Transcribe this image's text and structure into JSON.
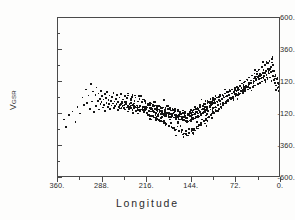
{
  "figure": {
    "background_color": "#fdfdfc",
    "frame_color": "#4a4a4a",
    "point_color": "#141414"
  },
  "axes": {
    "y_title_symbol": "V",
    "y_title_subscript": "GSR",
    "x_title": "Longitude"
  },
  "chart_data": {
    "type": "scatter",
    "title": "",
    "subtitle": "",
    "xlabel": "Longitude",
    "ylabel": "V_GSR",
    "xlim": [
      360,
      0
    ],
    "ylim": [
      -600,
      600
    ],
    "x_inverted": true,
    "grid": false,
    "legend": null,
    "x_ticks": [
      360,
      288,
      216,
      144,
      72,
      0
    ],
    "x_tick_labels": [
      "360.",
      "288.",
      "216.",
      "144.",
      "72.",
      "0."
    ],
    "x_minor_ticks": [
      324,
      252,
      180,
      108,
      36
    ],
    "y_ticks": [
      600,
      360,
      120,
      -120,
      -360,
      -600
    ],
    "y_tick_labels": [
      "600.",
      "360.",
      "120.",
      "-120.",
      "-360.",
      "-600."
    ],
    "y_minor_ticks": [
      480,
      240,
      0,
      -240,
      -480
    ],
    "marker": "square",
    "marker_size": 1.7,
    "n_points": 648,
    "series": [
      {
        "name": "HI clouds",
        "points": [
          [
            352,
            -155
          ],
          [
            349,
            -210
          ],
          [
            344,
            -120
          ],
          [
            338,
            -95
          ],
          [
            333,
            -175
          ],
          [
            330,
            -60
          ],
          [
            326,
            -110
          ],
          [
            322,
            10
          ],
          [
            319,
            -45
          ],
          [
            316,
            70
          ],
          [
            314,
            -30
          ],
          [
            312,
            25
          ],
          [
            310,
            -75
          ],
          [
            308,
            110
          ],
          [
            306,
            -20
          ],
          [
            305,
            55
          ],
          [
            303,
            -100
          ],
          [
            301,
            30
          ],
          [
            300,
            -55
          ],
          [
            299,
            85
          ],
          [
            297,
            -15
          ],
          [
            296,
            40
          ],
          [
            295,
            -80
          ],
          [
            294,
            0
          ],
          [
            293,
            -40
          ],
          [
            292,
            60
          ],
          [
            291,
            -25
          ],
          [
            290,
            20
          ],
          [
            289,
            -65
          ],
          [
            288,
            -5
          ],
          [
            287,
            -45
          ],
          [
            286,
            35
          ],
          [
            285,
            -90
          ],
          [
            284,
            5
          ],
          [
            283,
            -30
          ],
          [
            282,
            50
          ],
          [
            281,
            -60
          ],
          [
            280,
            -10
          ],
          [
            279,
            -40
          ],
          [
            278,
            25
          ],
          [
            277,
            -75
          ],
          [
            276,
            -15
          ],
          [
            275,
            -50
          ],
          [
            274,
            15
          ],
          [
            273,
            -35
          ],
          [
            272,
            45
          ],
          [
            271,
            -70
          ],
          [
            270,
            -20
          ],
          [
            269,
            -55
          ],
          [
            268,
            0
          ],
          [
            267,
            -40
          ],
          [
            266,
            30
          ],
          [
            265,
            -85
          ],
          [
            264,
            -25
          ],
          [
            263,
            -60
          ],
          [
            262,
            10
          ],
          [
            261,
            -45
          ],
          [
            260,
            35
          ],
          [
            259,
            -70
          ],
          [
            258,
            -30
          ],
          [
            257,
            -55
          ],
          [
            256,
            -5
          ],
          [
            255,
            -50
          ],
          [
            254,
            20
          ],
          [
            253,
            -80
          ],
          [
            252,
            -35
          ],
          [
            251,
            -65
          ],
          [
            250,
            5
          ],
          [
            249,
            -55
          ],
          [
            248,
            25
          ],
          [
            247,
            -75
          ],
          [
            246,
            -40
          ],
          [
            245,
            -60
          ],
          [
            244,
            -10
          ],
          [
            243,
            -50
          ],
          [
            242,
            15
          ],
          [
            241,
            -85
          ],
          [
            240,
            -45
          ],
          [
            239,
            -70
          ],
          [
            238,
            -15
          ],
          [
            237,
            -60
          ],
          [
            236,
            10
          ],
          [
            235,
            -90
          ],
          [
            234,
            -50
          ],
          [
            233,
            -75
          ],
          [
            232,
            -20
          ],
          [
            231,
            -65
          ],
          [
            230,
            0
          ],
          [
            229,
            -95
          ],
          [
            228,
            -55
          ],
          [
            227,
            -80
          ],
          [
            226,
            -25
          ],
          [
            225,
            -70
          ],
          [
            224,
            -5
          ],
          [
            223,
            -100
          ],
          [
            222,
            -60
          ],
          [
            221,
            -85
          ],
          [
            220,
            -30
          ],
          [
            219,
            -75
          ],
          [
            218,
            -110
          ],
          [
            217,
            -65
          ],
          [
            216,
            -35
          ],
          [
            215,
            -90
          ],
          [
            214,
            -120
          ],
          [
            213,
            -70
          ],
          [
            212,
            -40
          ],
          [
            211,
            -95
          ],
          [
            210,
            -130
          ],
          [
            209,
            -75
          ],
          [
            208,
            -45
          ],
          [
            207,
            -100
          ],
          [
            206,
            -140
          ],
          [
            205,
            -80
          ],
          [
            204,
            -50
          ],
          [
            203,
            -105
          ],
          [
            202,
            -150
          ],
          [
            201,
            -85
          ],
          [
            200,
            -55
          ],
          [
            199,
            -110
          ],
          [
            198,
            -160
          ],
          [
            197,
            -90
          ],
          [
            196,
            -60
          ],
          [
            195,
            -115
          ],
          [
            194,
            -170
          ],
          [
            193,
            -95
          ],
          [
            192,
            -65
          ],
          [
            191,
            -120
          ],
          [
            190,
            -180
          ],
          [
            189,
            -100
          ],
          [
            188,
            -70
          ],
          [
            187,
            -125
          ],
          [
            186,
            -190
          ],
          [
            185,
            -105
          ],
          [
            184,
            -75
          ],
          [
            183,
            -130
          ],
          [
            182,
            -200
          ],
          [
            181,
            -110
          ],
          [
            180,
            -80
          ],
          [
            179,
            -135
          ],
          [
            178,
            -210
          ],
          [
            177,
            -115
          ],
          [
            176,
            -85
          ],
          [
            175,
            -140
          ],
          [
            174,
            -220
          ],
          [
            173,
            -120
          ],
          [
            172,
            -90
          ],
          [
            171,
            -145
          ],
          [
            170,
            -230
          ],
          [
            169,
            -125
          ],
          [
            168,
            -95
          ],
          [
            167,
            -150
          ],
          [
            166,
            -240
          ],
          [
            165,
            -130
          ],
          [
            164,
            -100
          ],
          [
            163,
            -155
          ],
          [
            162,
            -250
          ],
          [
            161,
            -135
          ],
          [
            160,
            -105
          ],
          [
            159,
            -160
          ],
          [
            158,
            -260
          ],
          [
            157,
            -140
          ],
          [
            156,
            -110
          ],
          [
            155,
            -165
          ],
          [
            154,
            -270
          ],
          [
            153,
            -145
          ],
          [
            152,
            -115
          ],
          [
            151,
            -170
          ],
          [
            150,
            -255
          ],
          [
            149,
            -130
          ],
          [
            148,
            -100
          ],
          [
            147,
            -160
          ],
          [
            146,
            -240
          ],
          [
            145,
            -120
          ],
          [
            144,
            -90
          ],
          [
            143,
            -150
          ],
          [
            142,
            -225
          ],
          [
            141,
            -110
          ],
          [
            140,
            -80
          ],
          [
            139,
            -140
          ],
          [
            138,
            -210
          ],
          [
            137,
            -100
          ],
          [
            136,
            -70
          ],
          [
            135,
            -130
          ],
          [
            134,
            -195
          ],
          [
            133,
            -90
          ],
          [
            132,
            -60
          ],
          [
            131,
            -120
          ],
          [
            130,
            -180
          ],
          [
            129,
            -80
          ],
          [
            128,
            -50
          ],
          [
            127,
            -110
          ],
          [
            126,
            -165
          ],
          [
            125,
            -70
          ],
          [
            124,
            -40
          ],
          [
            123,
            -100
          ],
          [
            122,
            -150
          ],
          [
            121,
            -60
          ],
          [
            120,
            -30
          ],
          [
            119,
            -90
          ],
          [
            118,
            -135
          ],
          [
            117,
            -50
          ],
          [
            116,
            -20
          ],
          [
            115,
            -80
          ],
          [
            114,
            -120
          ],
          [
            113,
            -40
          ],
          [
            112,
            -10
          ],
          [
            111,
            -70
          ],
          [
            110,
            -105
          ],
          [
            109,
            -30
          ],
          [
            108,
            0
          ],
          [
            107,
            -60
          ],
          [
            106,
            -90
          ],
          [
            105,
            -20
          ],
          [
            104,
            10
          ],
          [
            103,
            -50
          ],
          [
            102,
            -75
          ],
          [
            101,
            -10
          ],
          [
            100,
            20
          ],
          [
            99,
            -40
          ],
          [
            98,
            -60
          ],
          [
            97,
            0
          ],
          [
            96,
            30
          ],
          [
            95,
            -30
          ],
          [
            94,
            -45
          ],
          [
            93,
            10
          ],
          [
            92,
            40
          ],
          [
            91,
            -20
          ],
          [
            90,
            -30
          ],
          [
            89,
            20
          ],
          [
            88,
            50
          ],
          [
            87,
            -10
          ],
          [
            86,
            -15
          ],
          [
            85,
            30
          ],
          [
            84,
            60
          ],
          [
            83,
            0
          ],
          [
            82,
            0
          ],
          [
            81,
            40
          ],
          [
            80,
            70
          ],
          [
            79,
            10
          ],
          [
            78,
            15
          ],
          [
            77,
            50
          ],
          [
            76,
            80
          ],
          [
            75,
            20
          ],
          [
            74,
            30
          ],
          [
            73,
            60
          ],
          [
            72,
            90
          ],
          [
            71,
            30
          ],
          [
            70,
            45
          ],
          [
            69,
            70
          ],
          [
            68,
            100
          ],
          [
            67,
            40
          ],
          [
            66,
            60
          ],
          [
            65,
            80
          ],
          [
            64,
            115
          ],
          [
            63,
            50
          ],
          [
            62,
            75
          ],
          [
            61,
            90
          ],
          [
            60,
            130
          ],
          [
            59,
            60
          ],
          [
            58,
            90
          ],
          [
            57,
            100
          ],
          [
            56,
            145
          ],
          [
            55,
            70
          ],
          [
            54,
            105
          ],
          [
            53,
            110
          ],
          [
            52,
            160
          ],
          [
            51,
            80
          ],
          [
            50,
            120
          ],
          [
            49,
            120
          ],
          [
            48,
            175
          ],
          [
            47,
            90
          ],
          [
            46,
            135
          ],
          [
            45,
            130
          ],
          [
            44,
            190
          ],
          [
            43,
            100
          ],
          [
            42,
            150
          ],
          [
            41,
            140
          ],
          [
            40,
            205
          ],
          [
            39,
            110
          ],
          [
            38,
            165
          ],
          [
            37,
            150
          ],
          [
            36,
            220
          ],
          [
            35,
            120
          ],
          [
            34,
            180
          ],
          [
            33,
            160
          ],
          [
            32,
            240
          ],
          [
            31,
            130
          ],
          [
            30,
            195
          ],
          [
            29,
            170
          ],
          [
            28,
            255
          ],
          [
            27,
            140
          ],
          [
            26,
            210
          ],
          [
            25,
            180
          ],
          [
            24,
            270
          ],
          [
            23,
            150
          ],
          [
            22,
            225
          ],
          [
            21,
            190
          ],
          [
            20,
            285
          ],
          [
            19,
            160
          ],
          [
            18,
            240
          ],
          [
            17,
            200
          ],
          [
            16,
            300
          ],
          [
            15,
            170
          ],
          [
            14,
            255
          ],
          [
            13,
            140
          ],
          [
            12,
            210
          ],
          [
            11,
            120
          ],
          [
            10,
            180
          ],
          [
            9,
            100
          ],
          [
            8,
            150
          ],
          [
            7,
            80
          ],
          [
            6,
            120
          ],
          [
            5,
            60
          ],
          [
            4,
            90
          ],
          [
            3,
            40
          ],
          [
            2,
            60
          ],
          [
            1,
            20
          ]
        ]
      }
    ]
  }
}
